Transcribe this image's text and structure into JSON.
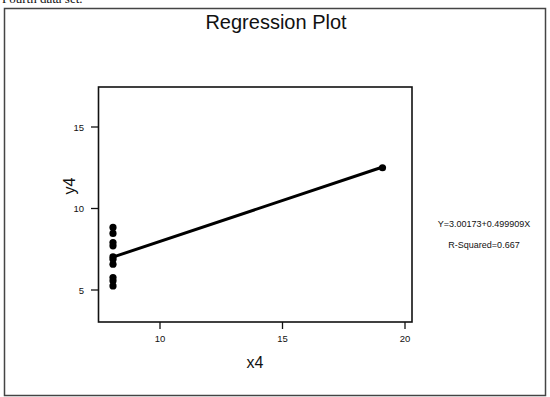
{
  "caption": "Fourth data set.",
  "chart_data": {
    "type": "scatter",
    "title": "Regression Plot",
    "xlabel": "x4",
    "ylabel": "y4",
    "xlim": [
      7.5,
      20.3
    ],
    "ylim": [
      3.2,
      17.6
    ],
    "xticks": [
      10,
      15,
      20
    ],
    "yticks": [
      5,
      10,
      15
    ],
    "grid": false,
    "series": [
      {
        "name": "observations",
        "x": [
          8,
          8,
          8,
          8,
          8,
          8,
          8,
          19,
          8,
          8,
          8
        ],
        "y": [
          6.58,
          5.76,
          7.71,
          8.84,
          8.47,
          7.04,
          5.25,
          12.5,
          5.56,
          7.91,
          6.89
        ]
      }
    ],
    "fit_line": {
      "intercept": 3.00173,
      "slope": 0.499909,
      "x_range": [
        8,
        19
      ]
    },
    "annotations": {
      "equation": "Y=3.00173+0.499909X",
      "r_squared": "R-Squared=0.667"
    }
  }
}
